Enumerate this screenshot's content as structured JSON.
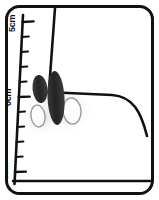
{
  "figure": {
    "background_color": "#ffffff",
    "ink_color": "#111111",
    "frame": {
      "name": "rounded-rectangle-border",
      "stroke_color": "#111111",
      "stroke_width": 3,
      "corner_radius": 14,
      "x": 5,
      "y": 5,
      "width": 149,
      "height": 190
    },
    "ruler": {
      "name": "vertical-centimetre-scale",
      "orientation": "vertical",
      "axis_color": "#111111",
      "label_rotation_degrees": -90,
      "labels": [
        {
          "text": "5cm",
          "value": 5,
          "x": 16,
          "y": 30
        },
        {
          "text": "0cm",
          "value": 0,
          "x": 16,
          "y": 104
        },
        {
          "text": "5cm",
          "value": -5,
          "x": 16,
          "y": 178
        }
      ],
      "major_tick_length": 11,
      "minor_tick_length": 7,
      "tick_count": 11,
      "ticks": [
        {
          "value": 5,
          "major": true,
          "y": 22
        },
        {
          "value": 4,
          "major": false,
          "y": 37
        },
        {
          "value": 3,
          "major": false,
          "y": 52
        },
        {
          "value": 2,
          "major": false,
          "y": 67
        },
        {
          "value": 1,
          "major": false,
          "y": 82
        },
        {
          "value": 0,
          "major": true,
          "y": 97
        },
        {
          "value": -1,
          "major": false,
          "y": 112
        },
        {
          "value": -2,
          "major": false,
          "y": 127
        },
        {
          "value": -3,
          "major": false,
          "y": 142
        },
        {
          "value": -4,
          "major": false,
          "y": 157
        },
        {
          "value": -5,
          "major": true,
          "y": 172
        }
      ]
    },
    "shapes": {
      "dark_ellipse_color": "#2b2b2b",
      "outline_ellipse_stroke": "#9a9a9a",
      "shadow_color": "#d8d8d8",
      "contour_stroke": "#111111",
      "dark_ellipses": [
        {
          "name": "dark-ellipse-left",
          "cx": 40,
          "cy": 89,
          "rx": 7,
          "ry": 14,
          "rotation": -6
        },
        {
          "name": "dark-ellipse-right",
          "cx": 56,
          "cy": 97,
          "rx": 8,
          "ry": 27,
          "rotation": -3
        }
      ],
      "outline_ellipses": [
        {
          "name": "outline-ellipse-left",
          "cx": 38,
          "cy": 116,
          "rx": 7,
          "ry": 11,
          "rotation": -8
        },
        {
          "name": "outline-ellipse-right",
          "cx": 72,
          "cy": 111,
          "rx": 9,
          "ry": 13,
          "rotation": -5
        }
      ]
    },
    "contours": [
      {
        "name": "left-ruler-axis-line",
        "path": "M 22 16 L 15 184"
      },
      {
        "name": "vertical-descending-contour",
        "path": "M 55 8 L 49 90"
      },
      {
        "name": "horizontal-curved-contour",
        "path": "M 48 93 L 112 95 C 132 96 141 110 146 132"
      },
      {
        "name": "bottom-baseline-contour",
        "path": "M 14 181 L 150 181"
      }
    ]
  }
}
